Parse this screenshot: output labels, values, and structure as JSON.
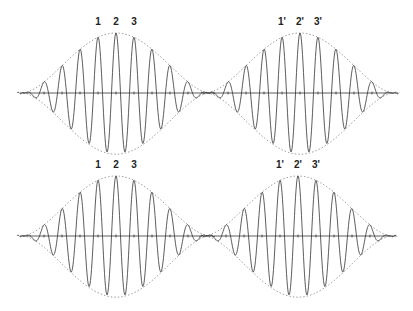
{
  "figure": {
    "rows": [
      {
        "id": "top",
        "baseline_y": 93,
        "amplitude": 60,
        "packets": [
          {
            "center_x": 116,
            "half_width": 93,
            "labels": [
              "1",
              "2",
              "3"
            ]
          },
          {
            "center_x": 300,
            "half_width": 93,
            "labels": [
              "1'",
              "2'",
              "3'"
            ]
          }
        ]
      },
      {
        "id": "bottom",
        "baseline_y": 236,
        "amplitude": 60,
        "packets": [
          {
            "center_x": 116,
            "half_width": 93,
            "labels": [
              "1",
              "2",
              "3"
            ]
          },
          {
            "center_x": 298,
            "half_width": 93,
            "labels": [
              "1'",
              "2'",
              "3'"
            ]
          }
        ]
      }
    ],
    "period_px": 18,
    "colors": {
      "wave": "#333333",
      "envelope": "#888888",
      "background": "#ffffff"
    }
  }
}
